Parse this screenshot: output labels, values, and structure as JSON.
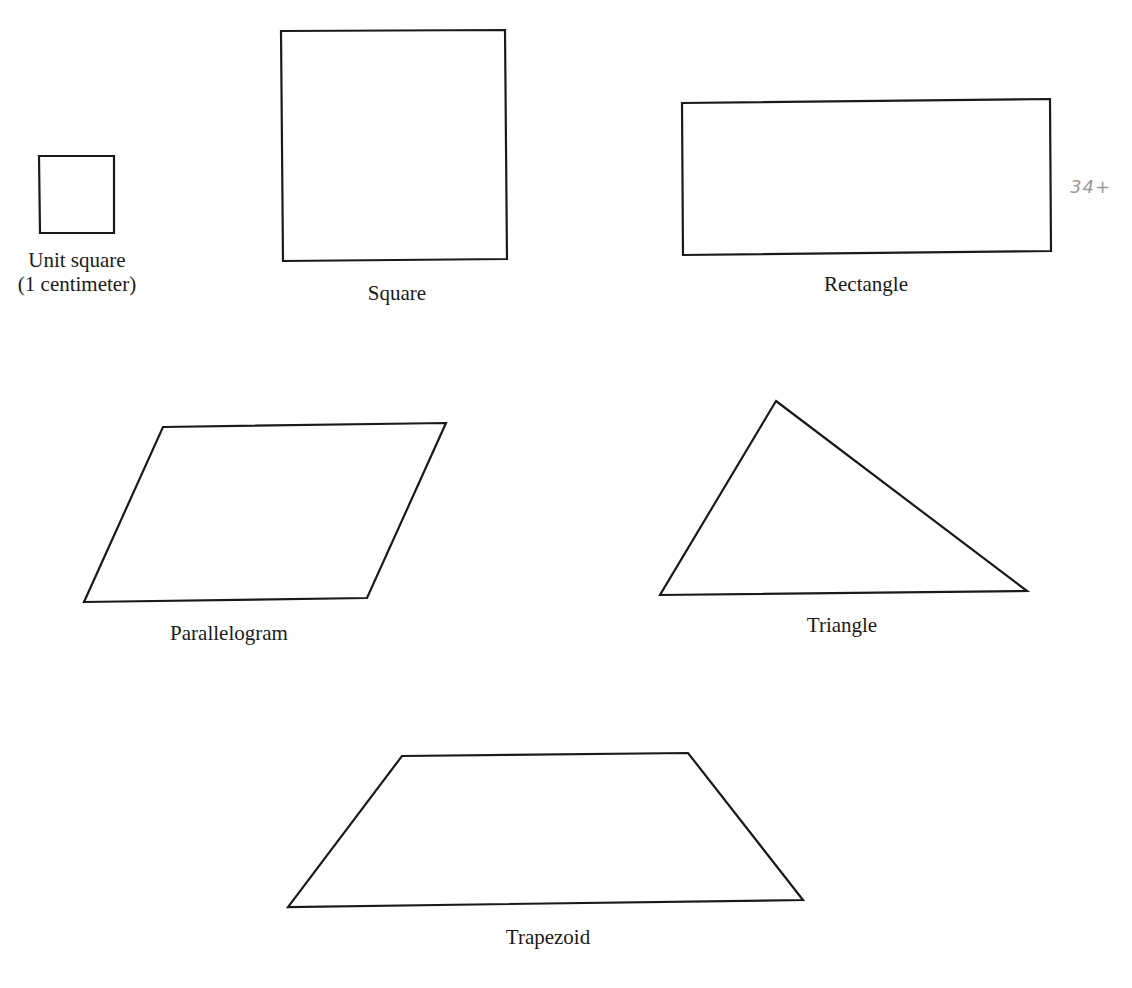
{
  "figure": {
    "shapes": [
      {
        "id": "unit-square",
        "label_line1": "Unit square",
        "label_line2": "(1 centimeter)",
        "points": "39,156 114,156 114,233 40,233"
      },
      {
        "id": "square",
        "label": "Square",
        "points": "281,31 505,30 507,259 283,261"
      },
      {
        "id": "rectangle",
        "label": "Rectangle",
        "points": "682,103 1050,99 1051,251 683,255"
      },
      {
        "id": "parallelogram",
        "label": "Parallelogram",
        "points": "163,427 446,423 367,598 84,602"
      },
      {
        "id": "triangle",
        "label": "Triangle",
        "points": "776,401 1027,591 660,595"
      },
      {
        "id": "trapezoid",
        "label": "Trapezoid",
        "points": "402,756 688,753 803,900 288,907"
      }
    ],
    "handwritten_note": "34+",
    "stroke_color": "#1a1a1a",
    "background_color": "#ffffff"
  }
}
